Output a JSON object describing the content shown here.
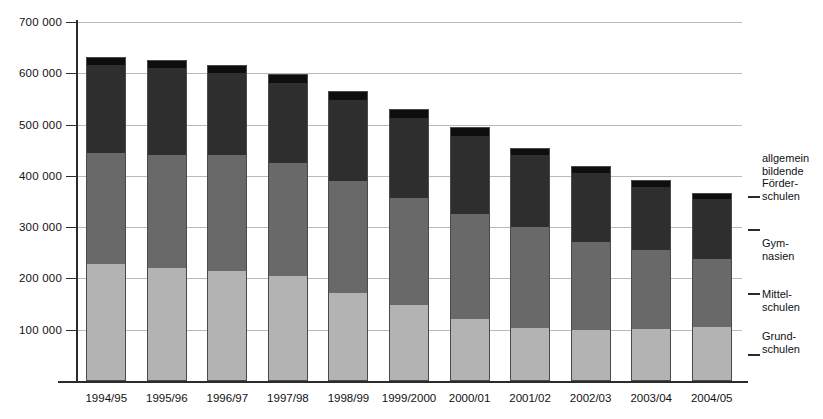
{
  "chart_data": {
    "type": "bar",
    "stacked": true,
    "title": "",
    "xlabel": "",
    "ylabel": "",
    "ylim": [
      0,
      700000
    ],
    "ytick_step": 100000,
    "grid": true,
    "legend_position": "right",
    "categories": [
      "1994/95",
      "1995/96",
      "1996/97",
      "1997/98",
      "1998/99",
      "1999/2000",
      "2000/01",
      "2001/02",
      "2002/03",
      "2003/04",
      "2004/05"
    ],
    "ytick_labels": [
      "700 000",
      "600 000",
      "500 000",
      "400 000",
      "300 000",
      "200 000",
      "100 000"
    ],
    "ytick_values": [
      700000,
      600000,
      500000,
      400000,
      300000,
      200000,
      100000
    ],
    "series": [
      {
        "name": "Grundschulen",
        "legend_label": "Grund-\nschulen",
        "color": "#b3b3b3",
        "values": [
          228000,
          221000,
          215000,
          204000,
          172000,
          149000,
          120000,
          104000,
          100000,
          101000,
          105000
        ]
      },
      {
        "name": "Mittelschulen",
        "legend_label": "Mittel-\nschulen",
        "color": "#696969",
        "values": [
          217000,
          219000,
          225000,
          222000,
          218000,
          207000,
          205000,
          196000,
          172000,
          155000,
          133000
        ]
      },
      {
        "name": "Gymnasien",
        "legend_label": "Gym-\nnasien",
        "color": "#2e2e2e",
        "values": [
          172000,
          171000,
          160000,
          156000,
          158000,
          157000,
          153000,
          140000,
          134000,
          123000,
          116000
        ]
      },
      {
        "name": "allgemein bildende Förderschulen",
        "legend_label": "allgemein\nbildende\nFörder-\nschulen",
        "color": "#0e0e0e",
        "values": [
          15000,
          15000,
          16000,
          16000,
          17000,
          17000,
          17000,
          15000,
          14000,
          13000,
          13000
        ]
      }
    ],
    "totals": [
      632000,
      626000,
      616000,
      598000,
      565000,
      530000,
      495000,
      455000,
      420000,
      392000,
      367000
    ]
  },
  "legend": {
    "entries": [
      {
        "label": "allgemein\nbildende\nFörder-\nschulen",
        "series": "allgemein bildende Förderschulen"
      },
      {
        "label": "Gym-\nnasien",
        "series": "Gymnasien"
      },
      {
        "label": "Mittel-\nschulen",
        "series": "Mittelschulen"
      },
      {
        "label": "Grund-\nschulen",
        "series": "Grundschulen"
      }
    ]
  }
}
